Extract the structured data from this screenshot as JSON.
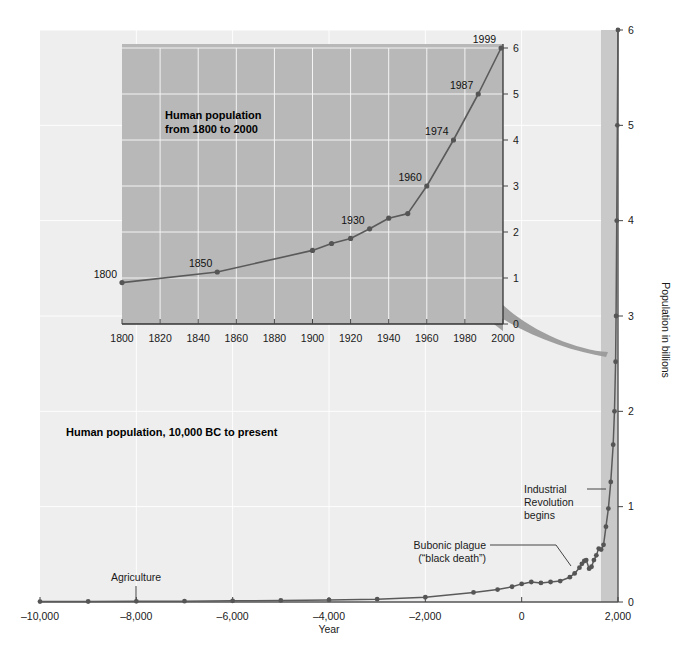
{
  "figure": {
    "background_color": "#ffffff",
    "main_panel_color": "#eeeeee",
    "inset_panel_color": "#b8b8b8",
    "gridline_color": "#ffffff",
    "line_color": "#5a5a5a",
    "marker_color": "#555555",
    "arrow_color": "#9a9a9a",
    "highlight_band_color": "#c9c9c9"
  },
  "chart_data": [
    {
      "id": "main",
      "type": "line",
      "title": "Human population, 10,000 BC to present",
      "xlabel": "Year",
      "ylabel": "Population in billions",
      "xlim": [
        -10000,
        2000
      ],
      "ylim": [
        0,
        6
      ],
      "grid": true,
      "legend_position": "none",
      "xticks": [
        -10000,
        -8000,
        -6000,
        -4000,
        -2000,
        0,
        2000
      ],
      "xtick_labels": [
        "–10,000",
        "–8,000",
        "–6,000",
        "–4,000",
        "–2,000",
        "0",
        "2,000"
      ],
      "yticks": [
        0,
        1,
        2,
        3,
        4,
        5,
        6
      ],
      "ytick_labels": [
        "0",
        "1",
        "2",
        "3",
        "4",
        "5",
        "6"
      ],
      "x": [
        -10000,
        -9000,
        -8000,
        -7000,
        -6000,
        -5000,
        -4000,
        -3000,
        -2000,
        -1000,
        -500,
        -200,
        0,
        200,
        400,
        600,
        800,
        1000,
        1100,
        1200,
        1250,
        1300,
        1340,
        1400,
        1450,
        1500,
        1550,
        1600,
        1650,
        1700,
        1750,
        1800,
        1850,
        1900,
        1927,
        1950,
        1960,
        1974,
        1987,
        1999
      ],
      "y": [
        0.004,
        0.005,
        0.007,
        0.009,
        0.012,
        0.016,
        0.022,
        0.03,
        0.05,
        0.1,
        0.13,
        0.16,
        0.19,
        0.21,
        0.2,
        0.21,
        0.22,
        0.26,
        0.3,
        0.36,
        0.4,
        0.43,
        0.44,
        0.35,
        0.37,
        0.44,
        0.49,
        0.56,
        0.55,
        0.6,
        0.79,
        0.98,
        1.26,
        1.65,
        2.0,
        2.52,
        3.0,
        4.0,
        5.0,
        6.0
      ],
      "annotations": [
        {
          "id": "agriculture",
          "text": "Agriculture",
          "x": -8000,
          "y": 0.0,
          "leader": true
        },
        {
          "id": "bubonic-plague",
          "text_line1": "Bubonic plague",
          "text_line2": "(“black death”)",
          "x": 1340,
          "y": 0.44,
          "leader": true
        },
        {
          "id": "industrial-revolution",
          "text_line1": "Industrial",
          "text_line2": "Revolution",
          "text_line3": "begins",
          "x": 1800,
          "y": 0.98,
          "leader": true
        }
      ],
      "highlight_band": {
        "x0": 1800,
        "x1": 2000,
        "label": "inset source range"
      }
    },
    {
      "id": "inset",
      "type": "line",
      "title": "Human population from 1800 to 2000",
      "title_line1": "Human population",
      "title_line2": "from 1800 to 2000",
      "xlabel": "",
      "ylabel": "",
      "xlim": [
        1800,
        2000
      ],
      "ylim": [
        0,
        6
      ],
      "grid": true,
      "legend_position": "none",
      "xticks": [
        1800,
        1820,
        1840,
        1860,
        1880,
        1900,
        1920,
        1940,
        1960,
        1980,
        2000
      ],
      "xtick_labels": [
        "1800",
        "1820",
        "1840",
        "1860",
        "1880",
        "1900",
        "1920",
        "1940",
        "1960",
        "1980",
        "2000"
      ],
      "yticks": [
        0,
        1,
        2,
        3,
        4,
        5,
        6
      ],
      "ytick_labels": [
        "0",
        "1",
        "2",
        "3",
        "4",
        "5",
        "6"
      ],
      "x": [
        1800,
        1850,
        1900,
        1910,
        1920,
        1930,
        1940,
        1950,
        1960,
        1974,
        1987,
        1999
      ],
      "y": [
        0.9,
        1.13,
        1.6,
        1.75,
        1.86,
        2.07,
        2.3,
        2.4,
        3.0,
        4.0,
        5.0,
        6.0
      ],
      "point_labels": [
        {
          "x": 1800,
          "y": 0.9,
          "text": "1800"
        },
        {
          "x": 1850,
          "y": 1.13,
          "text": "1850"
        },
        {
          "x": 1930,
          "y": 2.07,
          "text": "1930"
        },
        {
          "x": 1960,
          "y": 3.0,
          "text": "1960"
        },
        {
          "x": 1974,
          "y": 4.0,
          "text": "1974"
        },
        {
          "x": 1987,
          "y": 5.0,
          "text": "1987"
        },
        {
          "x": 1999,
          "y": 6.0,
          "text": "1999"
        }
      ]
    }
  ],
  "main": {
    "title": "Human population, 10,000 BC to present",
    "xaxis_title": "Year",
    "yaxis_title": "Population in billions",
    "xtick_labels": [
      "–10,000",
      "–8,000",
      "–6,000",
      "–4,000",
      "–2,000",
      "0",
      "2,000"
    ],
    "ytick_labels": [
      "0",
      "1",
      "2",
      "3",
      "4",
      "5",
      "6"
    ],
    "annotations": {
      "agriculture": "Agriculture",
      "plague_line1": "Bubonic plague",
      "plague_line2": "(“black death”)",
      "industrial_line1": "Industrial",
      "industrial_line2": "Revolution",
      "industrial_line3": "begins"
    }
  },
  "inset": {
    "title_line1": "Human population",
    "title_line2": "from 1800 to 2000",
    "xtick_labels": [
      "1800",
      "1820",
      "1840",
      "1860",
      "1880",
      "1900",
      "1920",
      "1940",
      "1960",
      "1980",
      "2000"
    ],
    "ytick_labels": [
      "0",
      "1",
      "2",
      "3",
      "4",
      "5",
      "6"
    ],
    "point_labels": [
      "1800",
      "1850",
      "1930",
      "1960",
      "1974",
      "1987",
      "1999"
    ]
  }
}
